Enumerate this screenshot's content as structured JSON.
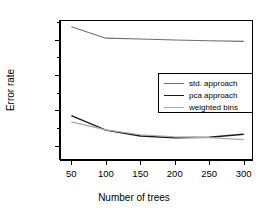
{
  "chart_data": {
    "type": "line",
    "title": "",
    "xlabel": "Number of trees",
    "ylabel": "Error rate",
    "xlim": [
      35,
      312
    ],
    "ylim": [
      0.2525,
      0.3305
    ],
    "grid": false,
    "legend_position": "center-right",
    "x": [
      50,
      100,
      150,
      200,
      250,
      300
    ],
    "xticks": [
      "50",
      "100",
      "150",
      "200",
      "250",
      "300"
    ],
    "yticks": [
      "0.26",
      "0.28",
      "0.30",
      "0.32"
    ],
    "ytick_values": [
      0.26,
      0.28,
      0.3,
      0.32
    ],
    "yticks_minor": [
      0.25,
      0.27,
      0.29,
      0.31,
      0.33
    ],
    "series": [
      {
        "name": "std. approach",
        "color": "#6e6e6e",
        "width": 1.1,
        "values": [
          0.3272,
          0.3208,
          0.3203,
          0.3198,
          0.3193,
          0.319
        ]
      },
      {
        "name": "pca approach",
        "color": "#1a1a1a",
        "width": 1.4,
        "values": [
          0.277,
          0.2688,
          0.2655,
          0.2645,
          0.2648,
          0.2665
        ]
      },
      {
        "name": "weighted bins",
        "color": "#a8a8a8",
        "width": 1.2,
        "values": [
          0.2735,
          0.269,
          0.2662,
          0.265,
          0.2646,
          0.2635
        ]
      }
    ]
  },
  "legend": {
    "entries": [
      {
        "label": "std. approach"
      },
      {
        "label": "pca approach"
      },
      {
        "label": "weighted bins"
      }
    ]
  },
  "axes": {
    "x_title": "Number of trees",
    "y_title": "Error rate"
  }
}
